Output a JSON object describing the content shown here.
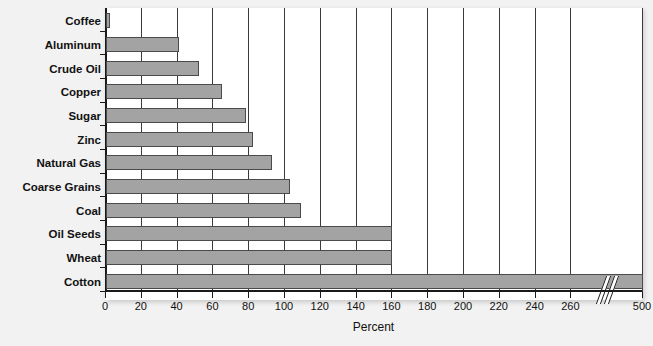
{
  "chart_data": {
    "type": "bar",
    "orientation": "horizontal",
    "title": "",
    "xlabel": "Percent",
    "ylabel": "",
    "categories": [
      "Coffee",
      "Aluminum",
      "Crude Oil",
      "Copper",
      "Sugar",
      "Zinc",
      "Natural Gas",
      "Coarse Grains",
      "Coal",
      "Oil Seeds",
      "Wheat",
      "Cotton"
    ],
    "values": [
      2,
      41,
      52,
      65,
      78,
      82,
      93,
      103,
      109,
      160,
      160,
      500
    ],
    "xticks": [
      0,
      20,
      40,
      60,
      80,
      100,
      120,
      140,
      160,
      180,
      200,
      220,
      240,
      260,
      500
    ],
    "xtick_labels": [
      "0",
      "20",
      "40",
      "60",
      "80",
      "100",
      "120",
      "140",
      "160",
      "180",
      "200",
      "220",
      "240",
      "260",
      "500"
    ],
    "xlim": [
      0,
      500
    ],
    "axis_break": {
      "after": 260,
      "before": 500,
      "style": "double-slash"
    },
    "grid": true,
    "grid_axis": "x",
    "legend": false,
    "bar_color": "#a3a3a3",
    "bar_edge_color": "#4a4a4a",
    "axis_color": "#1a1a1a",
    "plot_background": "#ffffff",
    "figure_background": "#f2f2f2"
  }
}
